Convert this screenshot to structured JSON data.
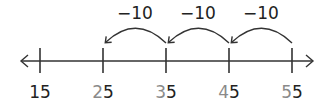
{
  "number_line": {
    "ticks": [
      {
        "value": 15,
        "tens": "1",
        "ones": "5",
        "tens_gray": false
      },
      {
        "value": 25,
        "tens": "2",
        "ones": "5",
        "tens_gray": true
      },
      {
        "value": 35,
        "tens": "3",
        "ones": "5",
        "tens_gray": true
      },
      {
        "value": 45,
        "tens": "4",
        "ones": "5",
        "tens_gray": true
      },
      {
        "value": 55,
        "tens": "5",
        "ones": "5",
        "tens_gray": true
      }
    ],
    "jumps": [
      {
        "label": "−10",
        "from": 55,
        "to": 45
      },
      {
        "label": "−10",
        "from": 45,
        "to": 35
      },
      {
        "label": "−10",
        "from": 35,
        "to": 25
      }
    ],
    "colors": {
      "line": "#333333",
      "label": "#222222",
      "tens_digit": "#8a8a8a"
    }
  }
}
